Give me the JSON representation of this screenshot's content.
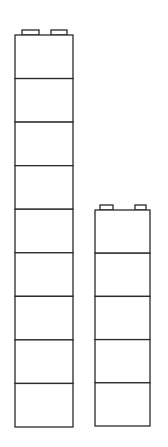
{
  "diagram": {
    "title": "",
    "stroke_color": "#2a2a2a",
    "fill_color": "#ffffff",
    "towers": [
      {
        "name": "tall-tower",
        "block_count": 9,
        "x": 15,
        "width": 58,
        "top": 35,
        "bottom": 427,
        "studs": [
          {
            "x": 22,
            "w": 17
          },
          {
            "x": 51,
            "w": 16
          }
        ],
        "stud_height": 5
      },
      {
        "name": "short-tower",
        "block_count": 5,
        "x": 95,
        "width": 55,
        "top": 210,
        "bottom": 426,
        "studs": [
          {
            "x": 100,
            "w": 13
          },
          {
            "x": 135,
            "w": 11
          }
        ],
        "stud_height": 5
      }
    ]
  }
}
